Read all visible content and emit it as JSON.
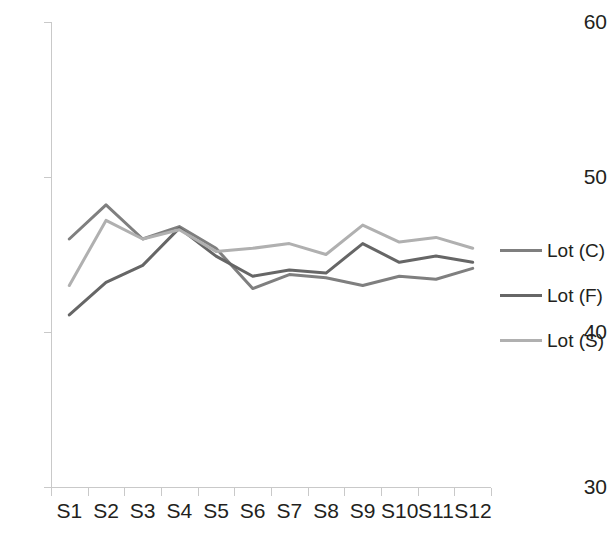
{
  "chart_data": {
    "type": "line",
    "title": "",
    "subtitle": "",
    "xlabel": "",
    "ylabel": "",
    "ylim": [
      30,
      60
    ],
    "yticks": [
      30,
      40,
      50,
      60
    ],
    "ytick_labels": [
      "30",
      "40",
      "50",
      "60"
    ],
    "grid": false,
    "legend_position": "right",
    "categories": [
      "S1",
      "S2",
      "S3",
      "S4",
      "S5",
      "S6",
      "S7",
      "S8",
      "S9",
      "S10",
      "S11",
      "S12"
    ],
    "series": [
      {
        "name": "Lot (C)",
        "color": "#7f7f7f",
        "values": [
          46.0,
          48.2,
          46.0,
          46.8,
          45.4,
          42.8,
          43.7,
          43.5,
          43.0,
          43.6,
          43.4,
          44.1
        ]
      },
      {
        "name": "Lot (F)",
        "color": "#666666",
        "values": [
          41.1,
          43.2,
          44.3,
          46.7,
          44.9,
          43.6,
          44.0,
          43.8,
          45.7,
          44.5,
          44.9,
          44.5
        ]
      },
      {
        "name": "Lot (S)",
        "color": "#b0b0b0",
        "values": [
          43.0,
          47.2,
          46.0,
          46.6,
          45.2,
          45.4,
          45.7,
          45.0,
          46.9,
          45.8,
          46.1,
          45.4
        ]
      }
    ]
  },
  "axes": {
    "y_labels": [
      "60",
      "50",
      "40",
      "30"
    ],
    "x_labels": [
      "S1",
      "S2",
      "S3",
      "S4",
      "S5",
      "S6",
      "S7",
      "S8",
      "S9",
      "S10",
      "S11",
      "S12"
    ],
    "axis_color": "#c9c9c9"
  },
  "legend": {
    "items": [
      {
        "label": "Lot (C)",
        "color": "#7f7f7f"
      },
      {
        "label": "Lot (F)",
        "color": "#666666"
      },
      {
        "label": "Lot (S)",
        "color": "#b0b0b0"
      }
    ]
  }
}
